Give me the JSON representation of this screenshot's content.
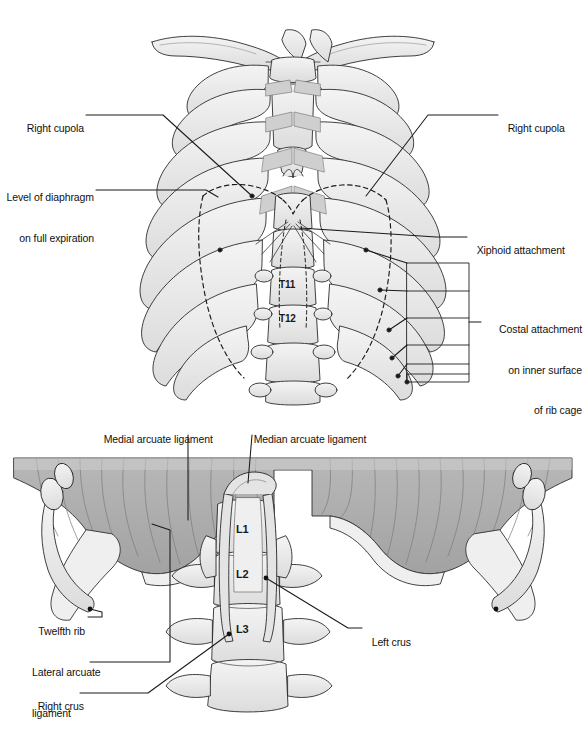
{
  "figure": {
    "background_color": "#ffffff",
    "line_color": "#1a1a1a",
    "bone_fill": "#ececec",
    "bone_shade": "#d6d6d6",
    "muscle_fill": "#b2b2b2",
    "muscle_shade": "#9c9c9c"
  },
  "upper_panel": {
    "name": "anterior-thoracic-cage",
    "vertebra_labels": [
      {
        "id": "T11",
        "text": "T11",
        "x": 288,
        "y": 284
      },
      {
        "id": "T12",
        "text": "T12",
        "x": 288,
        "y": 318
      }
    ],
    "labels": [
      {
        "id": "right-cupola-left",
        "text": "Right cupola",
        "side": "left",
        "x": 10,
        "y": 110,
        "lines": [
          "Right cupola"
        ]
      },
      {
        "id": "level-of-diaphragm",
        "text": "Level of diaphragm on full expiration",
        "side": "left",
        "x": 10,
        "y": 166,
        "lines": [
          "Level of diaphragm",
          "on full expiration"
        ]
      },
      {
        "id": "right-cupola-right",
        "text": "Right cupola",
        "side": "right",
        "x": 500,
        "y": 110,
        "lines": [
          "Right cupola"
        ]
      },
      {
        "id": "xiphoid-attachment",
        "text": "Xiphoid attachment",
        "side": "right",
        "x": 469,
        "y": 231,
        "lines": [
          "Xiphoid attachment"
        ]
      },
      {
        "id": "costal-attachment",
        "text": "Costal attachment on inner surface of rib cage",
        "side": "right",
        "x": 472,
        "y": 303,
        "lines": [
          "Costal attachment",
          "on inner surface",
          "of rib cage"
        ]
      }
    ]
  },
  "lower_panel": {
    "name": "diaphragm-inferior-view",
    "vertebra_labels": [
      {
        "id": "L1",
        "text": "L1",
        "x": 241,
        "y": 529
      },
      {
        "id": "L2",
        "text": "L2",
        "x": 241,
        "y": 574
      },
      {
        "id": "L3",
        "text": "L3",
        "x": 241,
        "y": 629
      }
    ],
    "labels": [
      {
        "id": "medial-arcuate-ligament",
        "text": "Medial arcuate ligament",
        "side": "top",
        "x": 99,
        "y": 421,
        "lines": [
          "Medial arcuate ligament"
        ]
      },
      {
        "id": "median-arcuate-ligament",
        "text": "Median arcuate ligament",
        "side": "top",
        "x": 249,
        "y": 421,
        "lines": [
          "Median arcuate ligament"
        ]
      },
      {
        "id": "twelfth-rib",
        "text": "Twelfth rib",
        "side": "left",
        "x": 34,
        "y": 619,
        "lines": [
          "Twelfth rib"
        ]
      },
      {
        "id": "lateral-arcuate-ligament",
        "text": "Lateral arcuate ligament",
        "side": "left",
        "x": 32,
        "y": 646,
        "lines": [
          "Lateral arcuate",
          "ligament"
        ]
      },
      {
        "id": "right-crus",
        "text": "Right crus",
        "side": "left",
        "x": 32,
        "y": 688,
        "lines": [
          "Right crus"
        ]
      },
      {
        "id": "left-crus",
        "text": "Left crus",
        "side": "right",
        "x": 364,
        "y": 624,
        "lines": [
          "Left crus"
        ]
      }
    ]
  },
  "caption": {
    "text": ""
  }
}
